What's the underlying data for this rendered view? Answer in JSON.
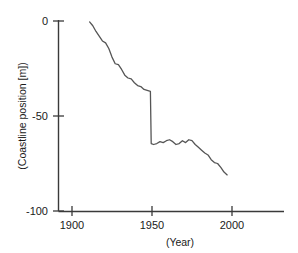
{
  "chart_data": {
    "type": "line",
    "title": "",
    "subtitle": "",
    "xlabel": "(Year)",
    "ylabel": "(Coastline position [m])",
    "xlim": [
      1900,
      2020
    ],
    "ylim": [
      -100,
      0
    ],
    "xticks": [
      1900,
      1950,
      2000
    ],
    "xtick_labels": [
      "1900",
      "1950",
      "2000"
    ],
    "yticks": [
      0,
      -50,
      -100
    ],
    "ytick_labels": [
      "0",
      "-50",
      "-100"
    ],
    "grid": false,
    "legend": null,
    "line_color": "#555555",
    "axis_color": "#3a3a3a",
    "background_color": "#ffffff",
    "annotations": [],
    "series": [
      {
        "name": "Coastline position",
        "x": [
          1911,
          1913,
          1915,
          1917,
          1919,
          1921,
          1923,
          1925,
          1927,
          1929,
          1931,
          1933,
          1935,
          1937,
          1939,
          1941,
          1943,
          1945,
          1947,
          1949,
          1949.5,
          1951,
          1953,
          1955,
          1957,
          1959,
          1961,
          1963,
          1965,
          1967,
          1969,
          1971,
          1973,
          1975,
          1977,
          1979,
          1981,
          1983,
          1985,
          1987,
          1989,
          1991,
          1993,
          1995,
          1997
        ],
        "y": [
          -0.5,
          -2.5,
          -5.5,
          -8.0,
          -10.5,
          -11.5,
          -14.5,
          -19.0,
          -22.5,
          -23.0,
          -25.5,
          -28.5,
          -30.0,
          -30.5,
          -32.5,
          -34.0,
          -34.5,
          -36.0,
          -36.5,
          -37.0,
          -64.5,
          -65.0,
          -64.5,
          -63.5,
          -64.0,
          -63.0,
          -62.5,
          -63.5,
          -65.0,
          -64.5,
          -63.0,
          -64.0,
          -62.5,
          -63.0,
          -65.0,
          -66.5,
          -68.0,
          -69.5,
          -70.5,
          -73.0,
          -74.5,
          -75.0,
          -77.0,
          -79.5,
          -81.0
        ]
      }
    ]
  },
  "axis": {
    "x_label": "(Year)",
    "y_label": "(Coastline position [m])"
  }
}
